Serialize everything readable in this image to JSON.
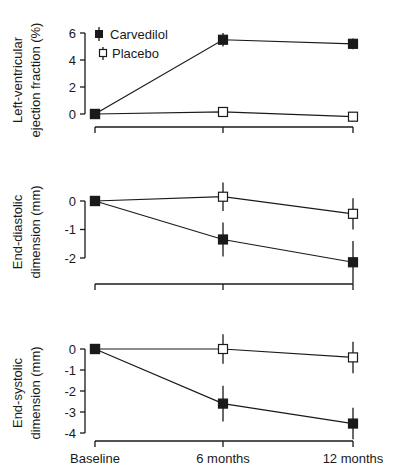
{
  "chart_data": [
    {
      "type": "line",
      "title": "",
      "xlabel": "",
      "ylabel": "Left-ventricular ejection fraction (%)",
      "ylabel_lines": [
        "Left-ventricular",
        "ejection fraction (%)"
      ],
      "categories": [
        "Baseline",
        "6 months",
        "12 months"
      ],
      "yticks": [
        0,
        2,
        4,
        6
      ],
      "ylim": [
        0,
        6
      ],
      "legend": {
        "position": "upper-left",
        "entries": [
          "Carvedilol",
          "Placebo"
        ]
      },
      "series": [
        {
          "name": "Carvedilol",
          "marker": "filled-square",
          "values": [
            0,
            5.5,
            5.2
          ],
          "error": [
            0,
            0.5,
            0.4
          ]
        },
        {
          "name": "Placebo",
          "marker": "open-square",
          "values": [
            0,
            0.15,
            -0.2
          ],
          "error": [
            0,
            0.35,
            0.35
          ]
        }
      ],
      "grid": false
    },
    {
      "type": "line",
      "title": "",
      "xlabel": "",
      "ylabel": "End-diastolic dimension (mm)",
      "ylabel_lines": [
        "End-diastolic",
        "dimension (mm)"
      ],
      "categories": [
        "Baseline",
        "6 months",
        "12 months"
      ],
      "yticks": [
        -2,
        -1,
        0
      ],
      "ylim": [
        -2,
        0
      ],
      "series": [
        {
          "name": "Carvedilol",
          "marker": "filled-square",
          "values": [
            0,
            -1.35,
            -2.15
          ],
          "error": [
            0,
            0.6,
            0.75
          ]
        },
        {
          "name": "Placebo",
          "marker": "open-square",
          "values": [
            0,
            0.15,
            -0.45
          ],
          "error": [
            0,
            0.5,
            0.55
          ]
        }
      ],
      "grid": false
    },
    {
      "type": "line",
      "title": "",
      "xlabel": "",
      "ylabel": "End-systolic dimension (mm)",
      "ylabel_lines": [
        "End-systolic",
        "dimension (mm)"
      ],
      "categories": [
        "Baseline",
        "6 months",
        "12 months"
      ],
      "yticks": [
        -4,
        -3,
        -2,
        -1,
        0
      ],
      "ylim": [
        -4,
        0
      ],
      "series": [
        {
          "name": "Carvedilol",
          "marker": "filled-square",
          "values": [
            0,
            -2.6,
            -3.55
          ],
          "error": [
            0,
            0.85,
            0.75
          ]
        },
        {
          "name": "Placebo",
          "marker": "open-square",
          "values": [
            0,
            0.0,
            -0.4
          ],
          "error": [
            0,
            0.7,
            0.75
          ]
        }
      ],
      "grid": false
    }
  ],
  "legend": {
    "carvedilol_label": "Carvedilol",
    "placebo_label": "Placebo"
  },
  "x_axis": {
    "labels": [
      "Baseline",
      "6 months",
      "12 months"
    ]
  },
  "colors": {
    "ink": "#1a1a1a",
    "background": "#ffffff"
  }
}
